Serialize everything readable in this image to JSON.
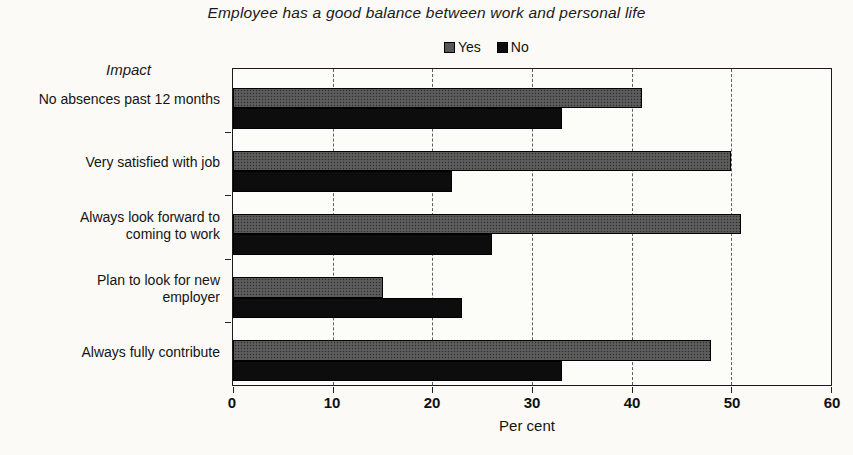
{
  "chart_data": {
    "type": "bar",
    "orientation": "horizontal",
    "title": "Employee has a good balance between work and personal life",
    "axis_heading": "Impact",
    "xlabel": "Per cent",
    "xlim": [
      0,
      60
    ],
    "xticks": [
      0,
      10,
      20,
      30,
      40,
      50,
      60
    ],
    "categories": [
      "No absences past 12 months",
      "Very satisfied with job",
      "Always look forward to\ncoming to work",
      "Plan to look for new\nemployer",
      "Always fully contribute"
    ],
    "series": [
      {
        "name": "Yes",
        "color": "#575757",
        "values": [
          41,
          50,
          51,
          15,
          48
        ]
      },
      {
        "name": "No",
        "color": "#0d0d0d",
        "values": [
          33,
          22,
          26,
          23,
          33
        ]
      }
    ],
    "grid": "dashed-vertical-lines",
    "legend_position": "top-center",
    "plot_background": "#fcfcf8",
    "page_background": "#fbfaf6"
  }
}
